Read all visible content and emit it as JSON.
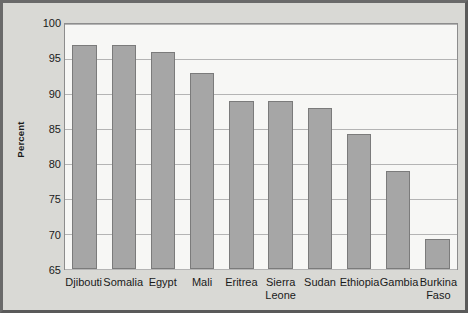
{
  "chart_data": {
    "type": "bar",
    "title": "",
    "xlabel": "",
    "ylabel": "Percent",
    "categories": [
      "Djibouti",
      "Somalia",
      "Egypt",
      "Mali",
      "Eritrea",
      "Sierra Leone",
      "Sudan",
      "Ethiopia",
      "Gambia",
      "Burkina Faso"
    ],
    "values": [
      97,
      97,
      96,
      93,
      89,
      89,
      88,
      84.3,
      79,
      69.3
    ],
    "ylim": [
      65,
      100
    ],
    "yticks": [
      65,
      70,
      75,
      80,
      85,
      90,
      95,
      100
    ],
    "ytick_labels": [
      "65",
      "70",
      "75",
      "80",
      "85",
      "90",
      "95",
      "100"
    ],
    "grid": true,
    "legend": "none",
    "colors": {
      "bar_fill": "#a6a6a6",
      "bar_edge": "#7b7b7b",
      "plot_background": "#f7f7f5",
      "figure_background": "#d9d9d5",
      "gridline": "#b4b4b4",
      "axis": "#8d8d8d",
      "text": "#1a1a1a"
    }
  }
}
